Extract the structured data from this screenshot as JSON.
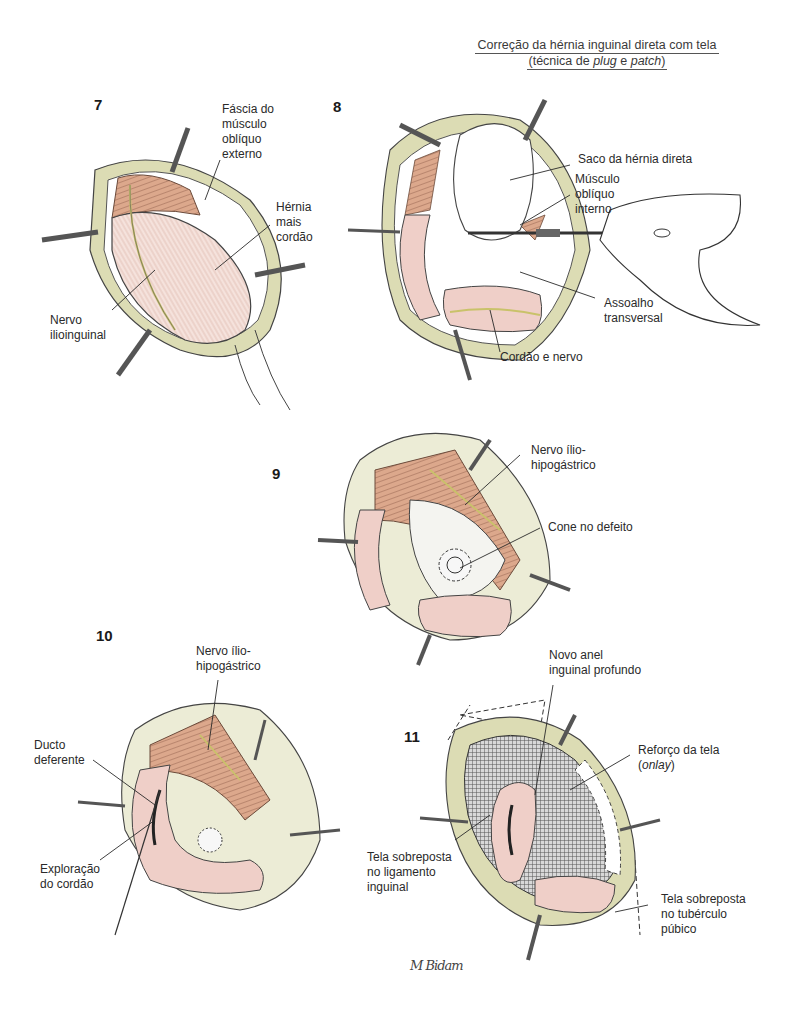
{
  "title": {
    "line1": "Correção da hérnia inguinal direta com tela",
    "line2_prefix": "(técnica de ",
    "line2_plug": "plug",
    "line2_mid": " e ",
    "line2_patch": "patch",
    "line2_suffix": ")"
  },
  "colors": {
    "muscle": "#d9a58a",
    "tissue_pink": "#efcfc8",
    "fat_yellow": "#dcdcb4",
    "mesh": "#6e6e6e",
    "nerve": "#c9c26a",
    "line": "#2a2a2a"
  },
  "panels": [
    {
      "number": "7",
      "labels": [
        {
          "id": "fascia",
          "text": "Fáscia do\nmúsculo\noblíquo\nexterno"
        },
        {
          "id": "hernia",
          "text": "Hérnia\nmais\ncordão"
        },
        {
          "id": "nervo",
          "text": "Nervo\nilioinguinal"
        }
      ]
    },
    {
      "number": "8",
      "labels": [
        {
          "id": "saco",
          "text": "Saco da hérnia direta"
        },
        {
          "id": "musculo",
          "text": "Músculo\noblíquo\ninterno"
        },
        {
          "id": "assoalho",
          "text": "Assoalho\ntransversal"
        },
        {
          "id": "cordao",
          "text": "Cordão e nervo"
        }
      ]
    },
    {
      "number": "9",
      "labels": [
        {
          "id": "nervo",
          "text": "Nervo ílio-\nhipogástrico"
        },
        {
          "id": "cone",
          "text": "Cone no defeito"
        }
      ]
    },
    {
      "number": "10",
      "labels": [
        {
          "id": "nervo",
          "text": "Nervo ílio-\nhipogástrico"
        },
        {
          "id": "ducto",
          "text": "Ducto\ndeferente"
        },
        {
          "id": "exploracao",
          "text": "Exploração\ndo cordão"
        }
      ]
    },
    {
      "number": "11",
      "labels": [
        {
          "id": "anel",
          "text": "Novo anel\ninguinal profundo"
        },
        {
          "id": "reforco_prefix",
          "text": "Reforço da tela"
        },
        {
          "id": "reforco_onlay",
          "text": "onlay"
        },
        {
          "id": "ligamento",
          "text": "Tela sobreposta\nno ligamento\ninguinal"
        },
        {
          "id": "tuberculo",
          "text": "Tela sobreposta\nno tubérculo\npúbico"
        }
      ]
    }
  ],
  "signature": "M Bidam"
}
